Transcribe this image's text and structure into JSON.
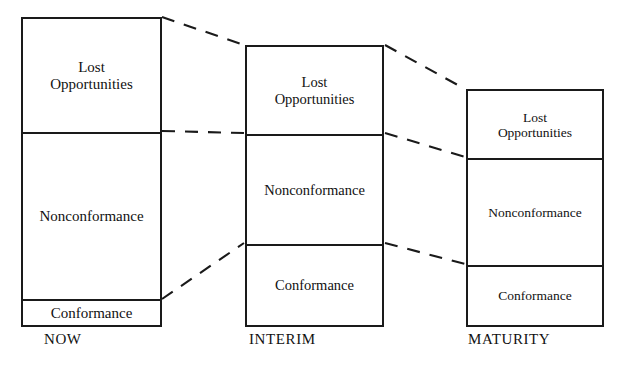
{
  "diagram": {
    "type": "cost-of-quality-stacked-bars",
    "background_color": "#ffffff",
    "line_color": "#1a1a1a",
    "text_color": "#111111",
    "columns": [
      {
        "id": "now",
        "caption": "NOW",
        "segments": [
          {
            "id": "lost-opportunities",
            "label": "Lost\nOpportunities"
          },
          {
            "id": "nonconformance",
            "label": "Nonconformance"
          },
          {
            "id": "conformance",
            "label": "Conformance"
          }
        ]
      },
      {
        "id": "interim",
        "caption": "INTERIM",
        "segments": [
          {
            "id": "lost-opportunities",
            "label": "Lost\nOpportunities"
          },
          {
            "id": "nonconformance",
            "label": "Nonconformance"
          },
          {
            "id": "conformance",
            "label": "Conformance"
          }
        ]
      },
      {
        "id": "maturity",
        "caption": "MATURITY",
        "segments": [
          {
            "id": "lost-opportunities",
            "label": "Lost\nOpportunities"
          },
          {
            "id": "nonconformance",
            "label": "Nonconformance"
          },
          {
            "id": "conformance",
            "label": "Conformance"
          }
        ]
      }
    ],
    "connectors": [
      {
        "id": "now-top-to-interim-top",
        "x1": 162,
        "y1": 17,
        "x2": 244,
        "y2": 45
      },
      {
        "id": "now-lost-divider-to-interim-lost-divider",
        "x1": 162,
        "y1": 131,
        "x2": 244,
        "y2": 133
      },
      {
        "id": "now-conf-divider-to-interim-conf-divider",
        "x1": 162,
        "y1": 299,
        "x2": 244,
        "y2": 243
      },
      {
        "id": "interim-top-to-maturity-top",
        "x1": 385,
        "y1": 45,
        "x2": 465,
        "y2": 89
      },
      {
        "id": "interim-lost-divider-to-maturity-lost-divider",
        "x1": 385,
        "y1": 133,
        "x2": 465,
        "y2": 157
      },
      {
        "id": "interim-conf-divider-to-maturity-conf-divider",
        "x1": 385,
        "y1": 243,
        "x2": 465,
        "y2": 264
      }
    ]
  }
}
